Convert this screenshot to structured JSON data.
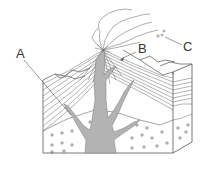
{
  "figure": {
    "labels": [
      {
        "id": "A",
        "text": "A"
      },
      {
        "id": "B",
        "text": "B"
      },
      {
        "id": "C",
        "text": "C"
      }
    ],
    "colors": {
      "line": "#555555",
      "magma": "#b3b3b3",
      "background": "#ffffff"
    }
  }
}
